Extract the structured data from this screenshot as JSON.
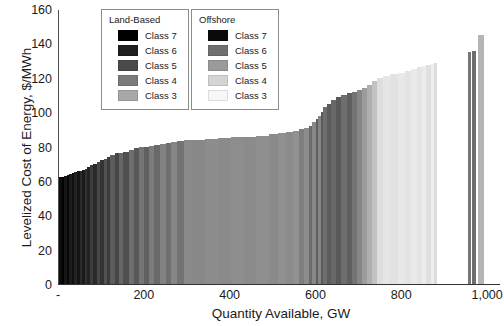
{
  "chart_data": {
    "type": "bar",
    "title": "",
    "subtitle": "",
    "xlabel": "Quantity Available, GW",
    "ylabel": "Levelized Cost of Energy, $/MWh",
    "xlim": [
      0,
      1030
    ],
    "ylim": [
      0,
      160
    ],
    "ytick_labels": [
      "160",
      "140",
      "120",
      "100",
      "80",
      "60",
      "40",
      "20",
      "0"
    ],
    "ytick_values": [
      160,
      140,
      120,
      100,
      80,
      60,
      40,
      20,
      0
    ],
    "xtick_labels": [
      "-",
      "200",
      "400",
      "600",
      "800",
      "1,000"
    ],
    "xtick_values": [
      0,
      200,
      400,
      600,
      800,
      1000
    ],
    "grid": false,
    "legend_position": "top-center",
    "series": [
      {
        "name": "Land-Based Class 7",
        "color": "#000000"
      },
      {
        "name": "Land-Based Class 6",
        "color": "#1f1f1f"
      },
      {
        "name": "Land-Based Class 5",
        "color": "#4a4a4a"
      },
      {
        "name": "Land-Based Class 4",
        "color": "#7a7a7a"
      },
      {
        "name": "Land-Based Class 3",
        "color": "#a8a8a8"
      },
      {
        "name": "Offshore Class 7",
        "color": "#0a0a0a"
      },
      {
        "name": "Offshore Class 6",
        "color": "#707070"
      },
      {
        "name": "Offshore Class 5",
        "color": "#9a9a9a"
      },
      {
        "name": "Offshore Class 4",
        "color": "#d4d4d4"
      },
      {
        "name": "Offshore Class 3",
        "color": "#f2f2f2"
      }
    ],
    "bars": [
      {
        "x0": 0,
        "x1": 6,
        "y": 62,
        "c": "#0d0d0d"
      },
      {
        "x0": 6,
        "x1": 12,
        "y": 62.5,
        "c": "#000000"
      },
      {
        "x0": 12,
        "x1": 18,
        "y": 63,
        "c": "#161616"
      },
      {
        "x0": 18,
        "x1": 24,
        "y": 63.5,
        "c": "#070707"
      },
      {
        "x0": 24,
        "x1": 30,
        "y": 64,
        "c": "#1c1c1c"
      },
      {
        "x0": 30,
        "x1": 36,
        "y": 64.5,
        "c": "#101010"
      },
      {
        "x0": 36,
        "x1": 42,
        "y": 65,
        "c": "#242424"
      },
      {
        "x0": 42,
        "x1": 48,
        "y": 65.5,
        "c": "#141414"
      },
      {
        "x0": 48,
        "x1": 54,
        "y": 66,
        "c": "#2b2b2b"
      },
      {
        "x0": 54,
        "x1": 60,
        "y": 66.5,
        "c": "#1a1a1a"
      },
      {
        "x0": 60,
        "x1": 66,
        "y": 67,
        "c": "#333333"
      },
      {
        "x0": 66,
        "x1": 72,
        "y": 68,
        "c": "#222222"
      },
      {
        "x0": 72,
        "x1": 80,
        "y": 69,
        "c": "#3d3d3d"
      },
      {
        "x0": 80,
        "x1": 88,
        "y": 70,
        "c": "#2a2a2a"
      },
      {
        "x0": 88,
        "x1": 96,
        "y": 71,
        "c": "#474747"
      },
      {
        "x0": 96,
        "x1": 104,
        "y": 72,
        "c": "#333333"
      },
      {
        "x0": 104,
        "x1": 112,
        "y": 73,
        "c": "#525252"
      },
      {
        "x0": 112,
        "x1": 120,
        "y": 74,
        "c": "#3b3b3b"
      },
      {
        "x0": 120,
        "x1": 130,
        "y": 75,
        "c": "#5c5c5c"
      },
      {
        "x0": 130,
        "x1": 140,
        "y": 76,
        "c": "#464646"
      },
      {
        "x0": 140,
        "x1": 150,
        "y": 76.5,
        "c": "#666666"
      },
      {
        "x0": 150,
        "x1": 162,
        "y": 77,
        "c": "#4f4f4f"
      },
      {
        "x0": 162,
        "x1": 174,
        "y": 78,
        "c": "#6e6e6e"
      },
      {
        "x0": 174,
        "x1": 186,
        "y": 79,
        "c": "#585858"
      },
      {
        "x0": 186,
        "x1": 198,
        "y": 79.5,
        "c": "#757575"
      },
      {
        "x0": 198,
        "x1": 210,
        "y": 80,
        "c": "#606060"
      },
      {
        "x0": 210,
        "x1": 222,
        "y": 80.5,
        "c": "#7c7c7c"
      },
      {
        "x0": 222,
        "x1": 236,
        "y": 81,
        "c": "#696969"
      },
      {
        "x0": 236,
        "x1": 250,
        "y": 81.5,
        "c": "#828282"
      },
      {
        "x0": 250,
        "x1": 262,
        "y": 82,
        "c": "#6f6f6f"
      },
      {
        "x0": 262,
        "x1": 276,
        "y": 82.5,
        "c": "#868686"
      },
      {
        "x0": 276,
        "x1": 292,
        "y": 83,
        "c": "#737373"
      },
      {
        "x0": 292,
        "x1": 312,
        "y": 83.5,
        "c": "#8a8a8a"
      },
      {
        "x0": 312,
        "x1": 340,
        "y": 84,
        "c": "#888888"
      },
      {
        "x0": 340,
        "x1": 370,
        "y": 84.5,
        "c": "#8d8d8d"
      },
      {
        "x0": 370,
        "x1": 400,
        "y": 85,
        "c": "#8a8a8a"
      },
      {
        "x0": 400,
        "x1": 430,
        "y": 85.3,
        "c": "#8e8e8e"
      },
      {
        "x0": 430,
        "x1": 460,
        "y": 85.6,
        "c": "#8b8b8b"
      },
      {
        "x0": 460,
        "x1": 490,
        "y": 86,
        "c": "#8f8f8f"
      },
      {
        "x0": 490,
        "x1": 510,
        "y": 87,
        "c": "#8a8a8a"
      },
      {
        "x0": 510,
        "x1": 528,
        "y": 88,
        "c": "#909090"
      },
      {
        "x0": 528,
        "x1": 545,
        "y": 88.5,
        "c": "#8b8b8b"
      },
      {
        "x0": 545,
        "x1": 560,
        "y": 89,
        "c": "#919191"
      },
      {
        "x0": 560,
        "x1": 572,
        "y": 90,
        "c": "#7e7e7e"
      },
      {
        "x0": 572,
        "x1": 582,
        "y": 91,
        "c": "#8c8c8c"
      },
      {
        "x0": 582,
        "x1": 590,
        "y": 92,
        "c": "#6b6b6b"
      },
      {
        "x0": 590,
        "x1": 598,
        "y": 94,
        "c": "#888888"
      },
      {
        "x0": 598,
        "x1": 604,
        "y": 96,
        "c": "#5e5e5e"
      },
      {
        "x0": 604,
        "x1": 610,
        "y": 98,
        "c": "#858585"
      },
      {
        "x0": 610,
        "x1": 616,
        "y": 100,
        "c": "#5a5a5a"
      },
      {
        "x0": 616,
        "x1": 624,
        "y": 103,
        "c": "#6e6e6e"
      },
      {
        "x0": 624,
        "x1": 634,
        "y": 105,
        "c": "#5c5c5c"
      },
      {
        "x0": 634,
        "x1": 646,
        "y": 107,
        "c": "#686868"
      },
      {
        "x0": 646,
        "x1": 658,
        "y": 109,
        "c": "#595959"
      },
      {
        "x0": 658,
        "x1": 670,
        "y": 110,
        "c": "#6d6d6d"
      },
      {
        "x0": 670,
        "x1": 682,
        "y": 111,
        "c": "#5f5f5f"
      },
      {
        "x0": 682,
        "x1": 694,
        "y": 112,
        "c": "#737373"
      },
      {
        "x0": 694,
        "x1": 706,
        "y": 113,
        "c": "#868686"
      },
      {
        "x0": 706,
        "x1": 718,
        "y": 114,
        "c": "#9c9c9c"
      },
      {
        "x0": 718,
        "x1": 730,
        "y": 116,
        "c": "#aeaeae"
      },
      {
        "x0": 730,
        "x1": 742,
        "y": 118,
        "c": "#c2c2c2"
      },
      {
        "x0": 742,
        "x1": 756,
        "y": 120,
        "c": "#dedede"
      },
      {
        "x0": 756,
        "x1": 772,
        "y": 121,
        "c": "#e6e6e6"
      },
      {
        "x0": 772,
        "x1": 790,
        "y": 122,
        "c": "#e2e2e2"
      },
      {
        "x0": 790,
        "x1": 806,
        "y": 123,
        "c": "#e8e8e8"
      },
      {
        "x0": 806,
        "x1": 820,
        "y": 124,
        "c": "#e3e3e3"
      },
      {
        "x0": 820,
        "x1": 834,
        "y": 125,
        "c": "#eaeaea"
      },
      {
        "x0": 834,
        "x1": 846,
        "y": 126,
        "c": "#e4e4e4"
      },
      {
        "x0": 846,
        "x1": 856,
        "y": 127,
        "c": "#ececec"
      },
      {
        "x0": 856,
        "x1": 866,
        "y": 127.5,
        "c": "#e0e0e0"
      },
      {
        "x0": 866,
        "x1": 874,
        "y": 128,
        "c": "#eeeeee"
      },
      {
        "x0": 874,
        "x1": 880,
        "y": 128.5,
        "c": "#dcdcdc"
      },
      {
        "x0": 952,
        "x1": 960,
        "y": 135,
        "c": "#767676"
      },
      {
        "x0": 963,
        "x1": 971,
        "y": 135.5,
        "c": "#6e6e6e"
      },
      {
        "x0": 976,
        "x1": 990,
        "y": 145,
        "c": "#b5b5b5"
      }
    ]
  },
  "legends": [
    {
      "name": "land-based",
      "title": "Land-Based",
      "entries": [
        {
          "label": "Class 7",
          "color": "#000000"
        },
        {
          "label": "Class 6",
          "color": "#1f1f1f"
        },
        {
          "label": "Class 5",
          "color": "#4a4a4a"
        },
        {
          "label": "Class 4",
          "color": "#7a7a7a"
        },
        {
          "label": "Class 3",
          "color": "#a8a8a8"
        }
      ]
    },
    {
      "name": "offshore",
      "title": "Offshore",
      "entries": [
        {
          "label": "Class 7",
          "color": "#0a0a0a"
        },
        {
          "label": "Class 6",
          "color": "#707070"
        },
        {
          "label": "Class 5",
          "color": "#9a9a9a"
        },
        {
          "label": "Class 4",
          "color": "#d4d4d4"
        },
        {
          "label": "Class 3",
          "color": "#f7f7f7"
        }
      ]
    }
  ]
}
